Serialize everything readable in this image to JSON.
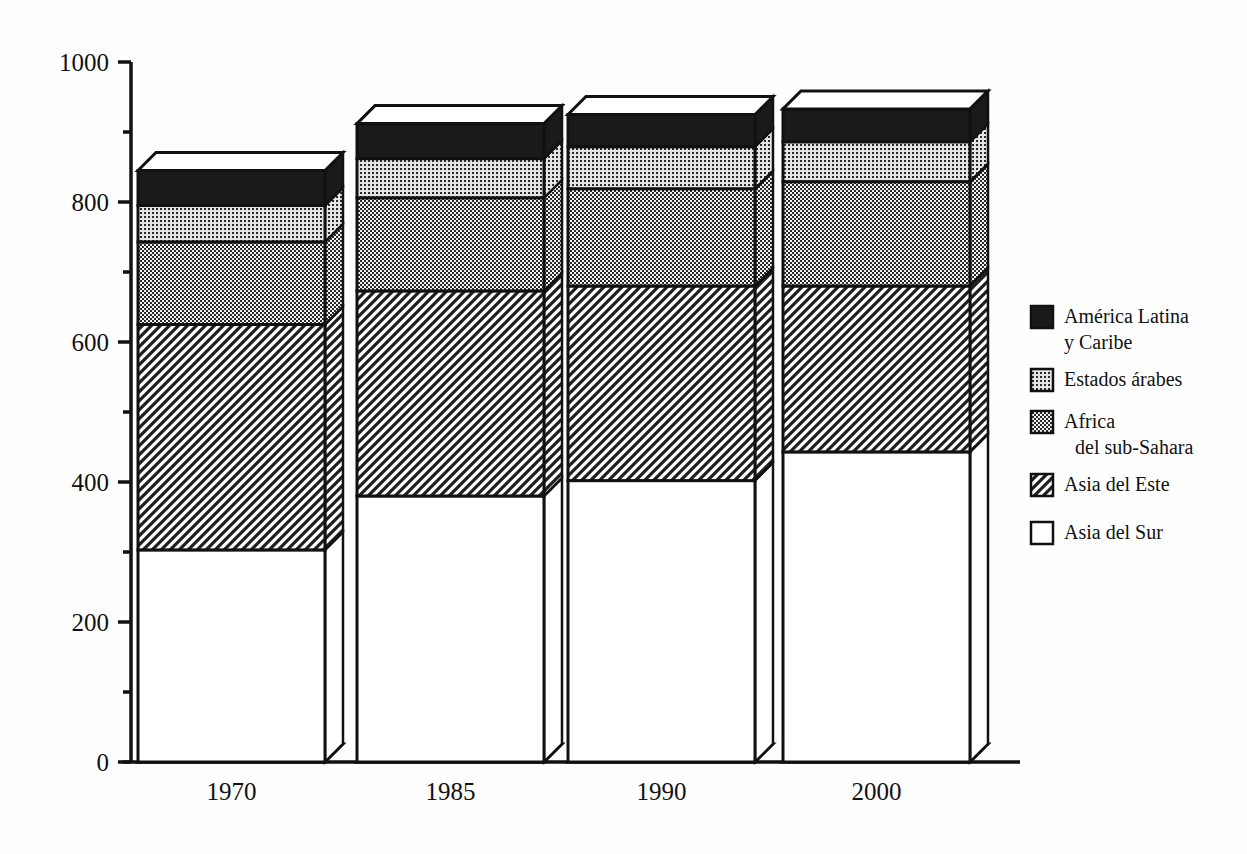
{
  "chart_data": {
    "type": "bar",
    "subtype": "stacked-3d-column",
    "title": "",
    "xlabel": "",
    "ylabel": "",
    "categories": [
      "1970",
      "1985",
      "1990",
      "2000"
    ],
    "ylim": [
      0,
      1000
    ],
    "yticks": [
      0,
      200,
      400,
      600,
      800,
      1000
    ],
    "ytick_labels": [
      "0",
      "200",
      "400",
      "600",
      "800",
      "1000"
    ],
    "yminorticks": [
      100,
      300,
      500,
      700,
      900
    ],
    "grid": false,
    "legend_position": "right",
    "stack_order_bottom_to_top": [
      "Asia del Sur",
      "Asia del Este",
      "Africa del sub-Sahara",
      "Estados árabes",
      "América Latina y Caribe"
    ],
    "series": [
      {
        "name": "Asia del Sur",
        "pattern": "white",
        "values": [
          303,
          380,
          402,
          443
        ]
      },
      {
        "name": "Asia del Este",
        "pattern": "diagonal",
        "values": [
          322,
          293,
          278,
          237
        ]
      },
      {
        "name": "Africa del sub-Sahara",
        "pattern": "checker-dark",
        "values": [
          118,
          133,
          139,
          149
        ]
      },
      {
        "name": "Estados árabes",
        "pattern": "dots-light",
        "values": [
          52,
          56,
          60,
          57
        ]
      },
      {
        "name": "América Latina y Caribe",
        "pattern": "solid-black",
        "values": [
          50,
          50,
          46,
          47
        ]
      }
    ],
    "cumulative_tops": [
      [
        303,
        625,
        743,
        795,
        845
      ],
      [
        380,
        673,
        806,
        862,
        912
      ],
      [
        402,
        680,
        819,
        879,
        925
      ],
      [
        443,
        680,
        829,
        886,
        933
      ]
    ],
    "totals": [
      845,
      912,
      925,
      933
    ]
  },
  "legend": {
    "items": [
      {
        "pattern": "solid-black",
        "line1": "América Latina",
        "line2": "y Caribe"
      },
      {
        "pattern": "dots-light",
        "line1": "Estados árabes",
        "line2": ""
      },
      {
        "pattern": "checker-dark",
        "line1": "Africa",
        "line2": "del sub-Sahara"
      },
      {
        "pattern": "diagonal",
        "line1": "Asia del Este",
        "line2": ""
      },
      {
        "pattern": "white",
        "line1": "Asia del Sur",
        "line2": ""
      }
    ]
  },
  "colors": {
    "ink": "#111111",
    "paper": "#fefefe",
    "black_fill": "#1a1a1a",
    "dark_checker_bg": "#6e6e6e",
    "light_dots_bg": "#d8d8d8"
  }
}
